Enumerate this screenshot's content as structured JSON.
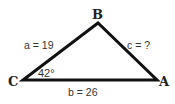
{
  "diagram": {
    "type": "triangle",
    "vertices": {
      "A": {
        "label": "A"
      },
      "B": {
        "label": "B"
      },
      "C": {
        "label": "C"
      }
    },
    "sides": {
      "a": {
        "label": "a = 19",
        "length": 19,
        "between": [
          "B",
          "C"
        ]
      },
      "b": {
        "label": "b = 26",
        "length": 26,
        "between": [
          "C",
          "A"
        ]
      },
      "c": {
        "label": "c = ?",
        "length": null,
        "between": [
          "B",
          "A"
        ]
      }
    },
    "angles": {
      "C": {
        "label": "42°",
        "value_degrees": 42
      }
    },
    "colors": {
      "stroke": "#111111",
      "text": "#333333",
      "background": "#ffffff"
    }
  }
}
